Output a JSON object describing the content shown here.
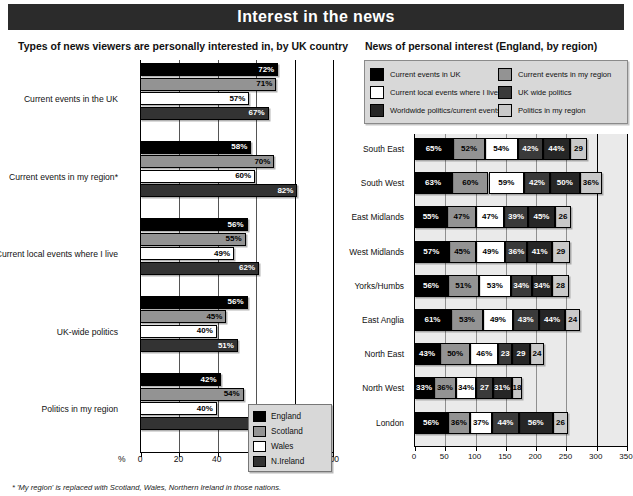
{
  "banner": {
    "title": "Interest in the news"
  },
  "subtitles": {
    "left": "Types of news viewers are personally interested in, by UK country",
    "right": "News of personal interest (England, by region)"
  },
  "footnote": "* 'My region' is replaced with Scotland, Wales, Northern Ireland in those nations.",
  "colors": {
    "england": "#000000",
    "scotland": "#939393",
    "wales": "#ffffff",
    "nireland": "#333333",
    "current_events_uk": "#000000",
    "current_events_my_region": "#939393",
    "current_local_events": "#ffffff",
    "uk_wide_politics": "#3a3a3a",
    "worldwide_politics": "#262626",
    "politics_my_region": "#c9c9c9",
    "banner_bg": "#2b2b2b",
    "legend_bg": "#d8d8d8",
    "plot_bg": "#eaeaea"
  },
  "left_legend": [
    {
      "label": "England",
      "color": "#000000"
    },
    {
      "label": "Scotland",
      "color": "#939393"
    },
    {
      "label": "Wales",
      "color": "#ffffff"
    },
    {
      "label": "N.Ireland",
      "color": "#333333"
    }
  ],
  "right_legend": [
    {
      "label": "Current events in UK",
      "color": "#000000"
    },
    {
      "label": "Current events in my region",
      "color": "#939393"
    },
    {
      "label": "Current local events where I live",
      "color": "#ffffff"
    },
    {
      "label": "UK wide politics",
      "color": "#3a3a3a"
    },
    {
      "label": "Worldwide politics/current events",
      "color": "#262626"
    },
    {
      "label": "Politics in my region",
      "color": "#c9c9c9"
    }
  ],
  "chart_data": [
    {
      "type": "bar",
      "id": "left",
      "orientation": "horizontal",
      "title": "Types of news viewers are personally interested in, by UK country",
      "xlabel": "%",
      "ylabel": "",
      "xlim": [
        0,
        100
      ],
      "xticks": [
        0,
        20,
        40,
        60,
        80,
        100
      ],
      "grid": true,
      "legend_position": "inside-bottom-right",
      "categories": [
        "Current events in the UK",
        "Current events in my region*",
        "Current local events where I live",
        "UK-wide politics",
        "Politics in my region"
      ],
      "series": [
        {
          "name": "England",
          "color": "#000000",
          "values": [
            72,
            58,
            56,
            56,
            42
          ]
        },
        {
          "name": "Scotland",
          "color": "#939393",
          "values": [
            71,
            70,
            55,
            45,
            54
          ]
        },
        {
          "name": "Wales",
          "color": "#ffffff",
          "values": [
            57,
            60,
            49,
            40,
            40
          ]
        },
        {
          "name": "N.Ireland",
          "color": "#333333",
          "values": [
            67,
            82,
            62,
            51,
            76
          ]
        }
      ],
      "labels": {
        "England": [
          "72%",
          "58%",
          "56%",
          "56%",
          "42%"
        ],
        "Scotland": [
          "71%",
          "70%",
          "55%",
          "45%",
          "54%"
        ],
        "Wales": [
          "57%",
          "60%",
          "49%",
          "40%",
          "40%"
        ],
        "N.Ireland": [
          "67%",
          "82%",
          "62%",
          "51%",
          "76%"
        ]
      }
    },
    {
      "type": "bar",
      "id": "right",
      "orientation": "horizontal",
      "stacked": true,
      "title": "News of personal interest (England, by region)",
      "xlabel": "",
      "ylabel": "",
      "xlim": [
        0,
        350
      ],
      "xticks": [
        0,
        50,
        100,
        150,
        200,
        250,
        300,
        350
      ],
      "grid": true,
      "legend_position": "top",
      "categories": [
        "South East",
        "South West",
        "East Midlands",
        "West Midlands",
        "Yorks/Humbs",
        "East Anglia",
        "North East",
        "North West",
        "London"
      ],
      "series": [
        {
          "name": "Current events in UK",
          "color": "#000000",
          "values": [
            65,
            63,
            55,
            57,
            56,
            61,
            43,
            33,
            56
          ]
        },
        {
          "name": "Current events in my region",
          "color": "#939393",
          "values": [
            52,
            60,
            47,
            45,
            51,
            53,
            50,
            36,
            36
          ]
        },
        {
          "name": "Current local events where I live",
          "color": "#ffffff",
          "values": [
            54,
            59,
            47,
            49,
            53,
            49,
            46,
            34,
            37
          ]
        },
        {
          "name": "UK wide politics",
          "color": "#3a3a3a",
          "values": [
            42,
            42,
            39,
            36,
            34,
            43,
            23,
            27,
            44
          ]
        },
        {
          "name": "Worldwide politics/current events",
          "color": "#262626",
          "values": [
            44,
            50,
            45,
            41,
            34,
            44,
            29,
            31,
            56
          ]
        },
        {
          "name": "Politics in my region",
          "color": "#c9c9c9",
          "values": [
            29,
            36,
            26,
            29,
            28,
            24,
            24,
            18,
            26
          ]
        }
      ],
      "labels": [
        [
          "65%",
          "52%",
          "54%",
          "42%",
          "44%",
          "29"
        ],
        [
          "63%",
          "60%",
          "59%",
          "42%",
          "50%",
          "36%"
        ],
        [
          "55%",
          "47%",
          "47%",
          "39%",
          "45%",
          "26"
        ],
        [
          "57%",
          "45%",
          "49%",
          "36%",
          "41%",
          "29"
        ],
        [
          "56%",
          "51%",
          "53%",
          "34%",
          "34%",
          "28"
        ],
        [
          "61%",
          "53%",
          "49%",
          "43%",
          "44%",
          "24"
        ],
        [
          "43%",
          "50%",
          "46%",
          "23",
          "29",
          "24"
        ],
        [
          "33%",
          "36%",
          "34%",
          "27",
          "31%",
          "18"
        ],
        [
          "56%",
          "36%",
          "37%",
          "44%",
          "56%",
          "26"
        ]
      ]
    }
  ]
}
